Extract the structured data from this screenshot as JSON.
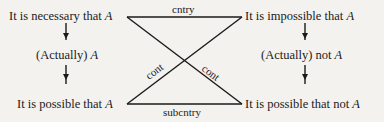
{
  "diagram": {
    "type": "modal square of opposition",
    "nodes": {
      "top_left": {
        "text": "It is necessary that",
        "var": "A"
      },
      "mid_left": {
        "text": "(Actually)",
        "var": "A"
      },
      "bottom_left": {
        "text": "It is possible that",
        "var": "A"
      },
      "top_right": {
        "text": "It is impossible that",
        "var": "A"
      },
      "mid_right": {
        "text": "(Actually) not",
        "var": "A"
      },
      "bottom_right": {
        "text": "It is possible that not",
        "var": "A"
      }
    },
    "edges": {
      "top": "cntry",
      "bottom": "subcntry",
      "diag_left": "cont",
      "diag_right": "cont"
    },
    "colors": {
      "line": "#1a1a1a",
      "background": "#f4f2ef"
    }
  }
}
